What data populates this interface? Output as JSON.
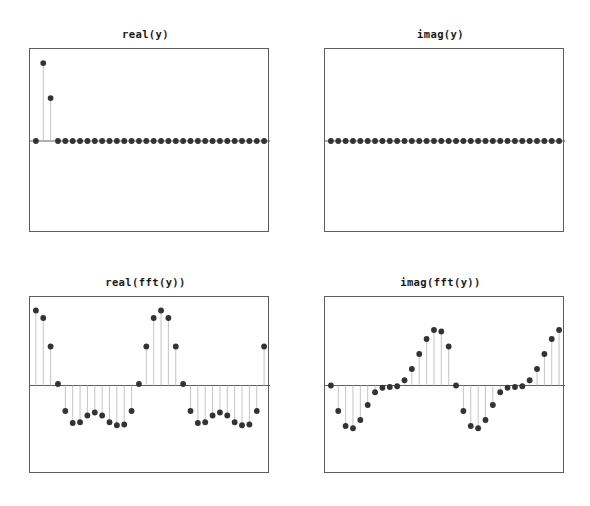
{
  "figure": {
    "width": 590,
    "height": 506,
    "background": "#ffffff",
    "layout": "2x2-grid-of-stem-plots",
    "marker_color": "#333333",
    "stem_color": "#bdbdbd",
    "baseline_color": "#4d4d4d",
    "axes_edge_color": "#5c5c5c"
  },
  "panels": {
    "top_left": {
      "title": "real(y)"
    },
    "top_right": {
      "title": "imag(y)"
    },
    "bottom_left": {
      "title": "real(fft(y))"
    },
    "bottom_right": {
      "title": "imag(fft(y))"
    }
  },
  "chart_data": [
    {
      "type": "stem",
      "id": "real-y",
      "title": "real(y)",
      "xlabel": "",
      "ylabel": "",
      "grid": false,
      "legend": null,
      "n": 32,
      "x": [
        0,
        1,
        2,
        3,
        4,
        5,
        6,
        7,
        8,
        9,
        10,
        11,
        12,
        13,
        14,
        15,
        16,
        17,
        18,
        19,
        20,
        21,
        22,
        23,
        24,
        25,
        26,
        27,
        28,
        29,
        30,
        31
      ],
      "values": [
        0,
        1,
        0.55,
        0,
        0,
        0,
        0,
        0,
        0,
        0,
        0,
        0,
        0,
        0,
        0,
        0,
        0,
        0,
        0,
        0,
        0,
        0,
        0,
        0,
        0,
        0,
        0,
        0,
        0,
        0,
        0,
        0
      ],
      "xlim": [
        -0.8,
        31.8
      ],
      "ylim": [
        -1.18,
        1.18
      ]
    },
    {
      "type": "stem",
      "id": "imag-y",
      "title": "imag(y)",
      "xlabel": "",
      "ylabel": "",
      "grid": false,
      "legend": null,
      "n": 32,
      "x": [
        0,
        1,
        2,
        3,
        4,
        5,
        6,
        7,
        8,
        9,
        10,
        11,
        12,
        13,
        14,
        15,
        16,
        17,
        18,
        19,
        20,
        21,
        22,
        23,
        24,
        25,
        26,
        27,
        28,
        29,
        30,
        31
      ],
      "values": [
        0,
        0,
        0,
        0,
        0,
        0,
        0,
        0,
        0,
        0,
        0,
        0,
        0,
        0,
        0,
        0,
        0,
        0,
        0,
        0,
        0,
        0,
        0,
        0,
        0,
        0,
        0,
        0,
        0,
        0,
        0,
        0
      ],
      "xlim": [
        -0.8,
        31.8
      ],
      "ylim": [
        -1.18,
        1.18
      ]
    },
    {
      "type": "stem",
      "id": "real-fft-y",
      "title": "real(fft(y))",
      "xlabel": "",
      "ylabel": "",
      "grid": false,
      "legend": null,
      "n": 32,
      "x": [
        0,
        1,
        2,
        3,
        4,
        5,
        6,
        7,
        8,
        9,
        10,
        11,
        12,
        13,
        14,
        15,
        16,
        17,
        18,
        19,
        20,
        21,
        22,
        23,
        24,
        25,
        26,
        27,
        28,
        29,
        30,
        31
      ],
      "values": [
        1.0,
        0.9,
        0.52,
        0.02,
        -0.34,
        -0.5,
        -0.49,
        -0.4,
        -0.36,
        -0.4,
        -0.49,
        -0.53,
        -0.52,
        -0.34,
        0.02,
        0.52,
        0.9,
        1.0,
        0.9,
        0.52,
        0.02,
        -0.34,
        -0.5,
        -0.49,
        -0.4,
        -0.36,
        -0.4,
        -0.49,
        -0.53,
        -0.52,
        -0.34,
        0.52
      ],
      "xlim": [
        -0.8,
        31.8
      ],
      "ylim": [
        -1.18,
        1.18
      ]
    },
    {
      "type": "stem",
      "id": "imag-fft-y",
      "title": "imag(fft(y))",
      "xlabel": "",
      "ylabel": "",
      "grid": false,
      "legend": null,
      "n": 32,
      "x": [
        0,
        1,
        2,
        3,
        4,
        5,
        6,
        7,
        8,
        9,
        10,
        11,
        12,
        13,
        14,
        15,
        16,
        17,
        18,
        19,
        20,
        21,
        22,
        23,
        24,
        25,
        26,
        27,
        28,
        29,
        30,
        31
      ],
      "values": [
        0.0,
        -0.34,
        -0.54,
        -0.57,
        -0.46,
        -0.26,
        -0.09,
        -0.03,
        -0.02,
        -0.01,
        0.07,
        0.22,
        0.42,
        0.62,
        0.74,
        0.72,
        0.52,
        0.0,
        -0.34,
        -0.54,
        -0.57,
        -0.46,
        -0.26,
        -0.09,
        -0.03,
        -0.02,
        -0.01,
        0.07,
        0.22,
        0.42,
        0.62,
        0.74
      ],
      "xlim": [
        -0.8,
        31.8
      ],
      "ylim": [
        -1.18,
        1.18
      ]
    }
  ]
}
